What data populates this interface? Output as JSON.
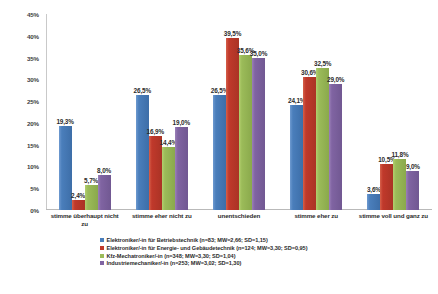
{
  "chart_data": {
    "type": "bar",
    "title": "",
    "subtitle": "",
    "xlabel": "",
    "ylabel": "",
    "ylim": [
      0,
      45
    ],
    "ytick_labels": [
      "0%",
      "5%",
      "10%",
      "15%",
      "20%",
      "25%",
      "30%",
      "35%",
      "40%",
      "45%"
    ],
    "ytick_values": [
      0,
      5,
      10,
      15,
      20,
      25,
      30,
      35,
      40,
      45
    ],
    "grid": false,
    "legend_position": "bottom",
    "value_label_suffix": "%",
    "decimal_separator": ",",
    "categories": [
      "stimme überhaupt nicht zu",
      "stimme eher nicht zu",
      "unentschieden",
      "stimme eher zu",
      "stimme voll und ganz zu"
    ],
    "series": [
      {
        "name": "Elektroniker/-in für Betriebstechnik (n=83; MW=2,66; SD=1,15)",
        "color": "#4a7ebb",
        "values": [
          19.3,
          26.5,
          26.5,
          24.1,
          3.6
        ],
        "labels": [
          "19,3%",
          "26,5%",
          "26,5%",
          "24,1%",
          "3,6%"
        ]
      },
      {
        "name": "Elektroniker/-in für Energie- und Gebäudetechnik (n=124; MW=3,30; SD=0,95)",
        "color": "#c0392b",
        "values": [
          2.4,
          16.9,
          39.5,
          30.6,
          10.5
        ],
        "labels": [
          "2,4%",
          "16,9%",
          "39,5%",
          "30,6%",
          "10,5%"
        ]
      },
      {
        "name": "Kfz-Mechatroniker/-in (n=348; MW=3,30; SD=1,04)",
        "color": "#9bbb59",
        "values": [
          5.7,
          14.4,
          35.6,
          32.5,
          11.8
        ],
        "labels": [
          "5,7%",
          "14,4%",
          "35,6%",
          "32,5%",
          "11,8%"
        ]
      },
      {
        "name": "Industriemechaniker/-in (n=253; MW=3,02; SD=1,30)",
        "color": "#8064a2",
        "values": [
          8.0,
          19.0,
          35.0,
          29.0,
          9.0
        ],
        "labels": [
          "8,0%",
          "19,0%",
          "35,0%",
          "29,0%",
          "9,0%"
        ]
      }
    ]
  }
}
